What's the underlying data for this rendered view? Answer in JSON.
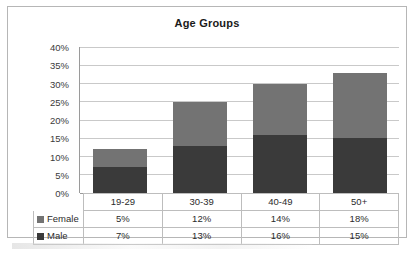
{
  "chart_data": {
    "type": "bar",
    "subtype": "stacked-column",
    "title": "Age Groups",
    "xlabel": "",
    "ylabel": "",
    "categories": [
      "19-29",
      "30-39",
      "40-49",
      "50+"
    ],
    "series": [
      {
        "name": "Male",
        "values": [
          7,
          13,
          16,
          15
        ],
        "color": "#3a3a3a",
        "display_values": [
          "7%",
          "13%",
          "16%",
          "15%"
        ]
      },
      {
        "name": "Female",
        "values": [
          5,
          12,
          14,
          18
        ],
        "color": "#737373",
        "display_values": [
          "5%",
          "12%",
          "14%",
          "18%"
        ]
      }
    ],
    "stack_order_bottom_to_top": [
      "Male",
      "Female"
    ],
    "totals": [
      12,
      25,
      30,
      33
    ],
    "ylim": [
      0,
      40
    ],
    "ytick_values": [
      0,
      5,
      10,
      15,
      20,
      25,
      30,
      35,
      40
    ],
    "ytick_labels": [
      "0%",
      "5%",
      "10%",
      "15%",
      "20%",
      "25%",
      "30%",
      "35%",
      "40%"
    ],
    "grid": true,
    "legend": "data-table",
    "units": "percent"
  },
  "table": {
    "header_row": {
      "corner_label": "",
      "cells": [
        "19-29",
        "30-39",
        "40-49",
        "50+"
      ]
    },
    "rows": [
      {
        "label": "Female",
        "swatch": "legend-swatch-female",
        "cells": [
          "5%",
          "12%",
          "14%",
          "18%"
        ]
      },
      {
        "label": "Male",
        "swatch": "legend-swatch-male",
        "cells": [
          "7%",
          "13%",
          "16%",
          "15%"
        ]
      }
    ]
  },
  "colors": {
    "female": "#737373",
    "male": "#3a3a3a",
    "gridline": "#c9c9c9",
    "axis": "#9a9a9a",
    "border": "#b6b6b6",
    "text": "#2b2b2b"
  }
}
